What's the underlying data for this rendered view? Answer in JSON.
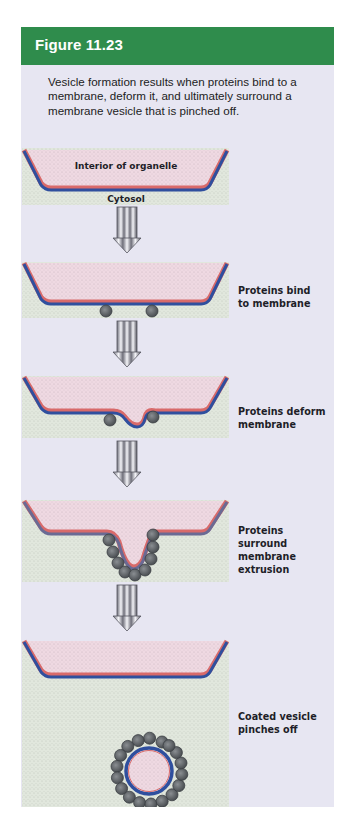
{
  "figure": {
    "title": "Figure 11.23",
    "caption": "Vesicle formation results when proteins bind to a membrane, deform it, and ultimately surround a membrane vesicle that is pinched off."
  },
  "colors": {
    "header_bg": "#2f8c4c",
    "panel_bg": "#e7e6f2",
    "interior_fill": "#efd9e2",
    "cytosol_fill": "#e1e7dd",
    "membrane_outer": "#2f4f9e",
    "membrane_inner": "#d86a6a",
    "protein_fill": "#5e6266",
    "arrow_fill": "#9a9aa6"
  },
  "stages": [
    {
      "id": 1,
      "label": "",
      "region_labels": {
        "interior": "Interior of organelle",
        "cytosol": "Cytosol"
      }
    },
    {
      "id": 2,
      "label": "Proteins bind\nto membrane"
    },
    {
      "id": 3,
      "label": "Proteins deform\nmembrane"
    },
    {
      "id": 4,
      "label": "Proteins surround\nmembrane\nextrusion"
    },
    {
      "id": 5,
      "label": "Coated vesicle\npinches off"
    }
  ]
}
